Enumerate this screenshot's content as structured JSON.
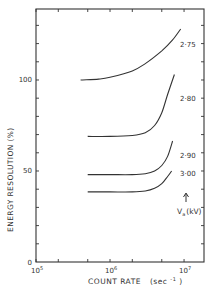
{
  "chart_data": {
    "type": "line",
    "title": "",
    "xlabel": "COUNT RATE",
    "xlabel_unit": "(sec",
    "xlabel_unit_exp": "-1",
    "xlabel_unit_close": ")",
    "ylabel": "ENERGY  RESOLUTION   (%)",
    "xscale": "log",
    "xlim": [
      100000,
      18600000
    ],
    "ylim": [
      0,
      139
    ],
    "x_ticks": [
      {
        "value": 100000,
        "base": "10",
        "exp": "5"
      },
      {
        "value": 1000000,
        "base": "10",
        "exp": "6"
      },
      {
        "value": 10000000,
        "base": "10",
        "exp": "7"
      }
    ],
    "x_minor_ticks": [
      200000,
      500000,
      2000000,
      5000000
    ],
    "y_ticks": [
      {
        "value": 0,
        "label": "0"
      },
      {
        "value": 50,
        "label": "50"
      },
      {
        "value": 100,
        "label": "100"
      }
    ],
    "y_minor_step": 10,
    "grid": false,
    "legend_title": "Va (kV)",
    "legend_title_main": "V",
    "legend_title_sub": "a",
    "legend_title_unit": "(kV)",
    "legend_placement": "right",
    "series": [
      {
        "name": "2·75",
        "points": [
          [
            400000,
            100
          ],
          [
            700000,
            100.5
          ],
          [
            1000000,
            101.5
          ],
          [
            2000000,
            105
          ],
          [
            3000000,
            109
          ],
          [
            5000000,
            116
          ],
          [
            7000000,
            122
          ],
          [
            9000000,
            128
          ]
        ]
      },
      {
        "name": "2·80",
        "points": [
          [
            500000,
            69
          ],
          [
            1000000,
            69
          ],
          [
            2000000,
            69.5
          ],
          [
            3000000,
            71
          ],
          [
            4000000,
            75
          ],
          [
            5000000,
            82
          ],
          [
            6000000,
            92
          ],
          [
            7400000,
            103
          ]
        ]
      },
      {
        "name": "2·90",
        "points": [
          [
            500000,
            48
          ],
          [
            1000000,
            48
          ],
          [
            2000000,
            48
          ],
          [
            3000000,
            48.5
          ],
          [
            4000000,
            50
          ],
          [
            5000000,
            53
          ],
          [
            6000000,
            58
          ],
          [
            7000000,
            66.5
          ]
        ]
      },
      {
        "name": "3·00",
        "points": [
          [
            500000,
            38.5
          ],
          [
            1000000,
            38.5
          ],
          [
            2000000,
            38.5
          ],
          [
            3000000,
            39
          ],
          [
            4000000,
            40.5
          ],
          [
            5000000,
            43
          ],
          [
            6000000,
            47
          ],
          [
            6800000,
            50
          ]
        ]
      }
    ]
  }
}
